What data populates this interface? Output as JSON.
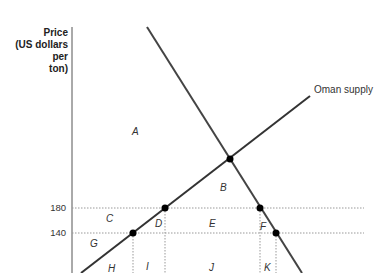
{
  "diagram": {
    "y_axis_label_lines": [
      "Price",
      "(US dollars",
      "per",
      "ton)"
    ],
    "y_ticks": [
      {
        "label": "180",
        "y": 208
      },
      {
        "label": "140",
        "y": 233
      }
    ],
    "curves": {
      "supply_label": "Oman supply",
      "demand_label": ""
    },
    "regions": {
      "A": "A",
      "B": "B",
      "C": "C",
      "D": "D",
      "E": "E",
      "F": "F",
      "G": "G",
      "H": "H",
      "I": "I",
      "J": "J",
      "K": "K"
    },
    "colors": {
      "line": "#333333",
      "dotted": "#999999",
      "point": "#000000"
    }
  }
}
